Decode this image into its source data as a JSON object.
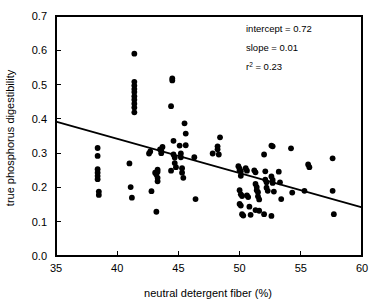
{
  "chart_data": {
    "type": "scatter",
    "title": "",
    "xlabel": "neutral detergent fiber (%)",
    "ylabel": "true  phosphorus digestibility",
    "xlim": [
      35,
      60
    ],
    "ylim": [
      0.0,
      0.7
    ],
    "xticks": [
      "35",
      "40",
      "45",
      "50",
      "55",
      "60"
    ],
    "xtick_values": [
      35,
      40,
      45,
      50,
      55,
      60
    ],
    "yticks": [
      "0.0",
      "0.1",
      "0.2",
      "0.3",
      "0.4",
      "0.5",
      "0.6",
      "0.7"
    ],
    "ytick_values": [
      0.0,
      0.1,
      0.2,
      0.3,
      0.4,
      0.5,
      0.6,
      0.7
    ],
    "grid": false,
    "legend": "none",
    "marker": "filled-circle",
    "marker_color": "#000000",
    "fit_line": {
      "type": "linear-regression",
      "x_start": 35,
      "y_start": 0.392,
      "x_end": 60,
      "y_end": 0.142,
      "color": "#000000"
    },
    "annotations": [
      {
        "label": "intercept = 0.72",
        "base": "intercept = 0.72",
        "sup": ""
      },
      {
        "label": "slope = 0.01",
        "base": "slope = 0.01",
        "sup": ""
      },
      {
        "label": "r2 = 0.23",
        "base": "r",
        "sup": "2",
        "tail": " = 0.23"
      }
    ],
    "stats": {
      "intercept": 0.72,
      "slope": 0.01,
      "r_squared": 0.23
    },
    "points": [
      [
        38.4,
        0.315
      ],
      [
        38.4,
        0.292
      ],
      [
        38.4,
        0.253
      ],
      [
        38.4,
        0.243
      ],
      [
        38.4,
        0.233
      ],
      [
        38.4,
        0.224
      ],
      [
        38.5,
        0.188
      ],
      [
        38.5,
        0.178
      ],
      [
        41.4,
        0.59
      ],
      [
        41.4,
        0.508
      ],
      [
        41.4,
        0.497
      ],
      [
        41.4,
        0.487
      ],
      [
        41.4,
        0.478
      ],
      [
        41.4,
        0.466
      ],
      [
        41.4,
        0.456
      ],
      [
        41.4,
        0.444
      ],
      [
        41.4,
        0.433
      ],
      [
        41.4,
        0.419
      ],
      [
        41.0,
        0.27
      ],
      [
        41.1,
        0.201
      ],
      [
        41.2,
        0.17
      ],
      [
        42.6,
        0.299
      ],
      [
        42.7,
        0.305
      ],
      [
        42.8,
        0.189
      ],
      [
        43.1,
        0.243
      ],
      [
        43.2,
        0.238
      ],
      [
        43.3,
        0.252
      ],
      [
        43.3,
        0.246
      ],
      [
        43.3,
        0.228
      ],
      [
        43.3,
        0.218
      ],
      [
        43.5,
        0.311
      ],
      [
        43.6,
        0.307
      ],
      [
        43.6,
        0.3
      ],
      [
        43.7,
        0.318
      ],
      [
        43.2,
        0.129
      ],
      [
        44.4,
        0.437
      ],
      [
        44.5,
        0.518
      ],
      [
        44.5,
        0.512
      ],
      [
        44.6,
        0.336
      ],
      [
        44.6,
        0.296
      ],
      [
        44.7,
        0.287
      ],
      [
        44.7,
        0.271
      ],
      [
        44.8,
        0.259
      ],
      [
        44.4,
        0.249
      ],
      [
        45.1,
        0.322
      ],
      [
        45.2,
        0.299
      ],
      [
        45.2,
        0.288
      ],
      [
        45.3,
        0.256
      ],
      [
        45.3,
        0.243
      ],
      [
        45.4,
        0.228
      ],
      [
        45.5,
        0.387
      ],
      [
        45.6,
        0.357
      ],
      [
        45.6,
        0.323
      ],
      [
        46.3,
        0.288
      ],
      [
        46.4,
        0.166
      ],
      [
        47.8,
        0.299
      ],
      [
        48.2,
        0.32
      ],
      [
        48.2,
        0.311
      ],
      [
        48.3,
        0.296
      ],
      [
        48.4,
        0.346
      ],
      [
        49.9,
        0.262
      ],
      [
        50.0,
        0.255
      ],
      [
        50.0,
        0.25
      ],
      [
        50.1,
        0.247
      ],
      [
        50.1,
        0.234
      ],
      [
        50.0,
        0.192
      ],
      [
        50.1,
        0.18
      ],
      [
        50.2,
        0.175
      ],
      [
        50.0,
        0.152
      ],
      [
        50.1,
        0.147
      ],
      [
        50.2,
        0.122
      ],
      [
        50.3,
        0.118
      ],
      [
        50.5,
        0.256
      ],
      [
        50.6,
        0.249
      ],
      [
        50.6,
        0.177
      ],
      [
        50.7,
        0.172
      ],
      [
        50.8,
        0.144
      ],
      [
        50.9,
        0.12
      ],
      [
        51.2,
        0.25
      ],
      [
        51.3,
        0.244
      ],
      [
        51.3,
        0.21
      ],
      [
        51.4,
        0.201
      ],
      [
        51.4,
        0.192
      ],
      [
        51.5,
        0.186
      ],
      [
        51.5,
        0.174
      ],
      [
        51.6,
        0.165
      ],
      [
        51.3,
        0.134
      ],
      [
        51.6,
        0.132
      ],
      [
        52.0,
        0.296
      ],
      [
        52.1,
        0.247
      ],
      [
        52.1,
        0.223
      ],
      [
        52.2,
        0.215
      ],
      [
        52.2,
        0.199
      ],
      [
        52.3,
        0.19
      ],
      [
        52.0,
        0.122
      ],
      [
        52.6,
        0.322
      ],
      [
        52.7,
        0.32
      ],
      [
        52.6,
        0.232
      ],
      [
        52.7,
        0.222
      ],
      [
        52.7,
        0.213
      ],
      [
        52.8,
        0.188
      ],
      [
        52.6,
        0.117
      ],
      [
        53.2,
        0.246
      ],
      [
        53.3,
        0.215
      ],
      [
        53.4,
        0.166
      ],
      [
        54.2,
        0.314
      ],
      [
        54.3,
        0.185
      ],
      [
        55.3,
        0.19
      ],
      [
        55.6,
        0.267
      ],
      [
        55.7,
        0.259
      ],
      [
        57.6,
        0.285
      ],
      [
        57.6,
        0.19
      ],
      [
        57.7,
        0.122
      ]
    ]
  }
}
